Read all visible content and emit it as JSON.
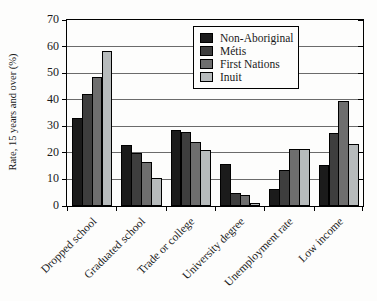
{
  "chart_data": {
    "type": "bar",
    "title": "",
    "categories": [
      "Dropped school",
      "Graduated school",
      "Trade or college",
      "University degree",
      "Unemployment rate",
      "Low income"
    ],
    "series": [
      {
        "name": "Non-Aboriginal",
        "color": "#1b1b1b",
        "values": [
          33,
          23,
          28.5,
          16,
          6.5,
          15.5
        ]
      },
      {
        "name": "Métis",
        "color": "#3e3e3e",
        "values": [
          42,
          20,
          28,
          5,
          13.5,
          27.5
        ]
      },
      {
        "name": "First Nations",
        "color": "#6e6e6e",
        "values": [
          48.5,
          16.5,
          24,
          4,
          21.5,
          39.5
        ]
      },
      {
        "name": "Inuit",
        "color": "#b7bbbc",
        "values": [
          58.5,
          10.5,
          21,
          1,
          21.5,
          23.5
        ]
      }
    ],
    "xlabel": "",
    "ylabel": "Rate, 15 years and over (%)",
    "ylim": [
      0,
      70
    ],
    "yticks": [
      0,
      10,
      20,
      30,
      40,
      50,
      60,
      70
    ],
    "grid": true,
    "legend_position": "top-right-inside",
    "axis_color": "#000000",
    "gridline_color": "#6b6b6b",
    "background_color": "#fdfdfc"
  }
}
